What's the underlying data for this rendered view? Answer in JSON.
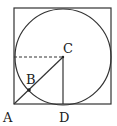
{
  "diagram": {
    "colors": {
      "stroke": "#333333",
      "background": "#ffffff"
    },
    "square": {
      "x": 14,
      "y": 8,
      "width": 97,
      "height": 96
    },
    "circle": {
      "cx": 63,
      "cy": 57,
      "r": 48
    },
    "points": {
      "A": {
        "label": "A",
        "x": 14,
        "y": 104
      },
      "B": {
        "label": "B",
        "x": 29,
        "y": 90
      },
      "C": {
        "label": "C",
        "x": 63,
        "y": 57
      },
      "D": {
        "label": "D",
        "x": 63,
        "y": 104
      }
    },
    "segments": [
      {
        "from": "A",
        "to": "C",
        "style": "solid"
      },
      {
        "from": "C",
        "to": "D",
        "style": "solid"
      },
      {
        "from": "left-edge",
        "to": "C",
        "style": "dashed"
      }
    ]
  }
}
